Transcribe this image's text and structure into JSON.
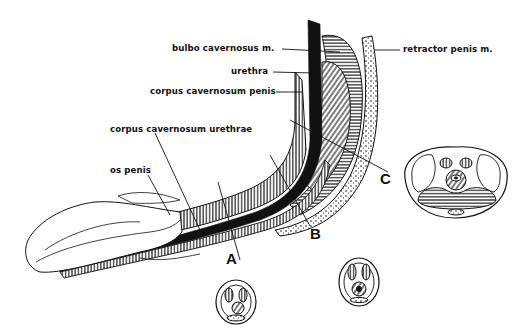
{
  "diagram": {
    "colors": {
      "ink": "#111111",
      "background": "#ffffff"
    },
    "labels": {
      "bulbo_cavernosus": "bulbo cavernosus m.",
      "urethra": "urethra",
      "corpus_cavernosum_penis": "corpus cavernosum penis",
      "corpus_cavernosum_urethrae": "corpus cavernosum urethrae",
      "os_penis": "os penis",
      "retractor_penis": "retractor penis m."
    },
    "sections": {
      "A": "A",
      "B": "B",
      "C": "C"
    }
  }
}
